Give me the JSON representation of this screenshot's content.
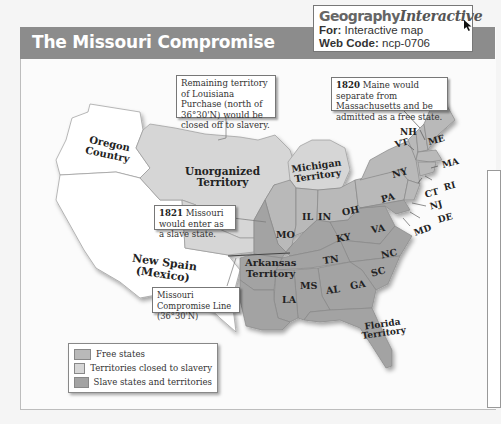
{
  "header": {
    "title": "The Missouri Compromise"
  },
  "geography_interactive": {
    "brand_word1": "Geography",
    "brand_word2": "Interactive",
    "for_label": "For:",
    "for_value": "Interactive map",
    "web_code_label": "Web Code:",
    "web_code_value": "ncp-0706",
    "icon": "cursor-arrow-icon"
  },
  "colors": {
    "free_states": "#b9b9b9",
    "territories_closed": "#d6d6d6",
    "slave_states": "#a3a3a3",
    "unshaded": "#ffffff",
    "title_bar": "#8c8c8c"
  },
  "callouts": {
    "louisiana": "Remaining territory of Louisiana Purchase (north of 36°30'N) would be closed off to slavery.",
    "maine_year": "1820",
    "maine_text": "Maine would separate from Massachusetts and be admitted as a free state.",
    "missouri_year": "1821",
    "missouri_text": "Missouri would enter as a slave state.",
    "compromise_line": "Missouri Compromise Line (36°30'N)"
  },
  "regions": {
    "oregon": [
      "Oregon",
      "Country"
    ],
    "unorganized": [
      "Unorganized",
      "Territory"
    ],
    "michigan": [
      "Michigan",
      "Territory"
    ],
    "new_spain": [
      "New Spain",
      "(Mexico)"
    ],
    "arkansas": [
      "Arkansas",
      "Territory"
    ],
    "florida": [
      "Florida",
      "Territory"
    ]
  },
  "states": {
    "NH": "NH",
    "VT": "VT",
    "ME": "ME",
    "MA": "MA",
    "NY": "NY",
    "RI": "RI",
    "CT": "CT",
    "NJ": "NJ",
    "PA": "PA",
    "DE": "DE",
    "MD": "MD",
    "OH": "OH",
    "IN": "IN",
    "IL": "IL",
    "MO": "MO",
    "KY": "KY",
    "VA": "VA",
    "NC": "NC",
    "TN": "TN",
    "SC": "SC",
    "GA": "GA",
    "AL": "AL",
    "MS": "MS",
    "LA": "LA"
  },
  "legend": {
    "items": [
      {
        "label": "Free states",
        "color": "#b9b9b9"
      },
      {
        "label": "Territories closed to slavery",
        "color": "#d6d6d6"
      },
      {
        "label": "Slave states and territories",
        "color": "#a3a3a3"
      }
    ]
  }
}
